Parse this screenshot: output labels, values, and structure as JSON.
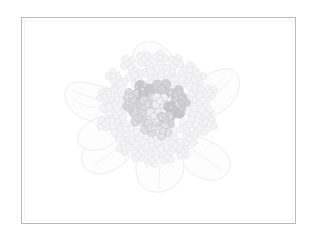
{
  "artwork": {
    "title": "Hydrangea flower head sketch",
    "medium": "pencil line drawing with light gray wash",
    "canvas": {
      "width": 316,
      "height": 241,
      "background_color": "#ffffff"
    },
    "frame": {
      "name": "thin rectangular border",
      "x": 21,
      "y": 17,
      "width": 275,
      "height": 207,
      "stroke_color": "#b9b9bd",
      "stroke_width": 1,
      "fill_color": "#ffffff"
    },
    "subject": {
      "name": "hydrangea-bloom",
      "center_x": 158,
      "center_y": 116,
      "outline_color": "#e2e2e6",
      "pale_floret_color": "#f4f4f6",
      "pale_floret_outline": "#e0e0e4"
    },
    "petals": {
      "name": "outer-petals",
      "count": 6,
      "stroke_color": "#e3e3e7",
      "fill_color": "#fcfcfd",
      "items": [
        {
          "label": "petal-upper-left",
          "angle": -145
        },
        {
          "label": "petal-upper-right",
          "angle": -35
        },
        {
          "label": "petal-right",
          "angle": 20
        },
        {
          "label": "petal-lower-right",
          "angle": 70
        },
        {
          "label": "petal-lower-left",
          "angle": 115
        },
        {
          "label": "petal-left",
          "angle": 170
        }
      ]
    },
    "floret_cluster": {
      "name": "central-floret-cluster",
      "description": "dense mass of four-lobed florets filling the bloom head",
      "pale_count": 46,
      "shaded_count": 14,
      "lobe_count_per_floret": 4
    },
    "shaded_florets": [
      {
        "id": "f01",
        "cx": 143,
        "cy": 92,
        "r": 11.0,
        "tone": "#c9c9cc"
      },
      {
        "id": "f02",
        "cx": 162,
        "cy": 89,
        "r": 10.0,
        "tone": "#d2d2d5"
      },
      {
        "id": "f03",
        "cx": 177,
        "cy": 95,
        "r": 9.0,
        "tone": "#cfcfd2"
      },
      {
        "id": "f04",
        "cx": 133,
        "cy": 106,
        "r": 9.5,
        "tone": "#d6d6d8"
      },
      {
        "id": "f05",
        "cx": 148,
        "cy": 104,
        "r": 9.0,
        "tone": "#dcdcde"
      },
      {
        "id": "f06",
        "cx": 160,
        "cy": 101,
        "r": 8.5,
        "tone": "#f0f0f1"
      },
      {
        "id": "f07",
        "cx": 174,
        "cy": 110,
        "r": 10.5,
        "tone": "#c6c6ca"
      },
      {
        "id": "f08",
        "cx": 139,
        "cy": 118,
        "r": 9.0,
        "tone": "#d9d9db"
      },
      {
        "id": "f09",
        "cx": 154,
        "cy": 116,
        "r": 8.5,
        "tone": "#ededee"
      },
      {
        "id": "f10",
        "cx": 166,
        "cy": 120,
        "r": 9.0,
        "tone": "#d4d4d7"
      },
      {
        "id": "f11",
        "cx": 150,
        "cy": 128,
        "r": 8.5,
        "tone": "#dedee0"
      },
      {
        "id": "f12",
        "cx": 163,
        "cy": 131,
        "r": 8.0,
        "tone": "#e3e3e5"
      },
      {
        "id": "f13",
        "cx": 131,
        "cy": 96,
        "r": 7.5,
        "tone": "#dbdbdd"
      },
      {
        "id": "f14",
        "cx": 182,
        "cy": 103,
        "r": 7.5,
        "tone": "#d0d0d3"
      }
    ],
    "pale_florets": [
      {
        "cx": 120,
        "cy": 84,
        "r": 8.0
      },
      {
        "cx": 135,
        "cy": 75,
        "r": 8.5
      },
      {
        "cx": 151,
        "cy": 71,
        "r": 8.5
      },
      {
        "cx": 167,
        "cy": 73,
        "r": 8.0
      },
      {
        "cx": 182,
        "cy": 79,
        "r": 8.5
      },
      {
        "cx": 195,
        "cy": 88,
        "r": 8.0
      },
      {
        "cx": 203,
        "cy": 100,
        "r": 8.5
      },
      {
        "cx": 206,
        "cy": 114,
        "r": 8.0
      },
      {
        "cx": 200,
        "cy": 128,
        "r": 8.5
      },
      {
        "cx": 190,
        "cy": 139,
        "r": 8.0
      },
      {
        "cx": 176,
        "cy": 146,
        "r": 8.5
      },
      {
        "cx": 161,
        "cy": 149,
        "r": 8.0
      },
      {
        "cx": 146,
        "cy": 147,
        "r": 8.5
      },
      {
        "cx": 132,
        "cy": 141,
        "r": 8.0
      },
      {
        "cx": 120,
        "cy": 133,
        "r": 8.5
      },
      {
        "cx": 112,
        "cy": 121,
        "r": 8.0
      },
      {
        "cx": 109,
        "cy": 107,
        "r": 8.5
      },
      {
        "cx": 112,
        "cy": 94,
        "r": 8.0
      },
      {
        "cx": 128,
        "cy": 63,
        "r": 7.5
      },
      {
        "cx": 144,
        "cy": 59,
        "r": 7.5
      },
      {
        "cx": 160,
        "cy": 58,
        "r": 7.5
      },
      {
        "cx": 176,
        "cy": 62,
        "r": 7.5
      },
      {
        "cx": 190,
        "cy": 70,
        "r": 7.5
      },
      {
        "cx": 126,
        "cy": 129,
        "r": 7.5
      },
      {
        "cx": 141,
        "cy": 134,
        "r": 7.5
      },
      {
        "cx": 156,
        "cy": 138,
        "r": 7.5
      },
      {
        "cx": 171,
        "cy": 134,
        "r": 7.5
      },
      {
        "cx": 185,
        "cy": 127,
        "r": 7.5
      },
      {
        "cx": 193,
        "cy": 114,
        "r": 7.5
      },
      {
        "cx": 120,
        "cy": 113,
        "r": 7.5
      },
      {
        "cx": 122,
        "cy": 100,
        "r": 7.0
      },
      {
        "cx": 190,
        "cy": 99,
        "r": 7.0
      },
      {
        "cx": 155,
        "cy": 83,
        "r": 7.0
      },
      {
        "cx": 172,
        "cy": 84,
        "r": 7.0
      },
      {
        "cx": 139,
        "cy": 84,
        "r": 7.0
      },
      {
        "cx": 113,
        "cy": 76,
        "r": 7.0
      },
      {
        "cx": 199,
        "cy": 78,
        "r": 7.0
      },
      {
        "cx": 104,
        "cy": 96,
        "r": 7.0
      },
      {
        "cx": 210,
        "cy": 92,
        "r": 7.0
      },
      {
        "cx": 104,
        "cy": 124,
        "r": 7.0
      },
      {
        "cx": 210,
        "cy": 124,
        "r": 7.0
      },
      {
        "cx": 138,
        "cy": 155,
        "r": 7.0
      },
      {
        "cx": 167,
        "cy": 157,
        "r": 7.0
      },
      {
        "cx": 152,
        "cy": 160,
        "r": 7.0
      },
      {
        "cx": 183,
        "cy": 152,
        "r": 7.0
      },
      {
        "cx": 124,
        "cy": 148,
        "r": 7.0
      }
    ]
  }
}
